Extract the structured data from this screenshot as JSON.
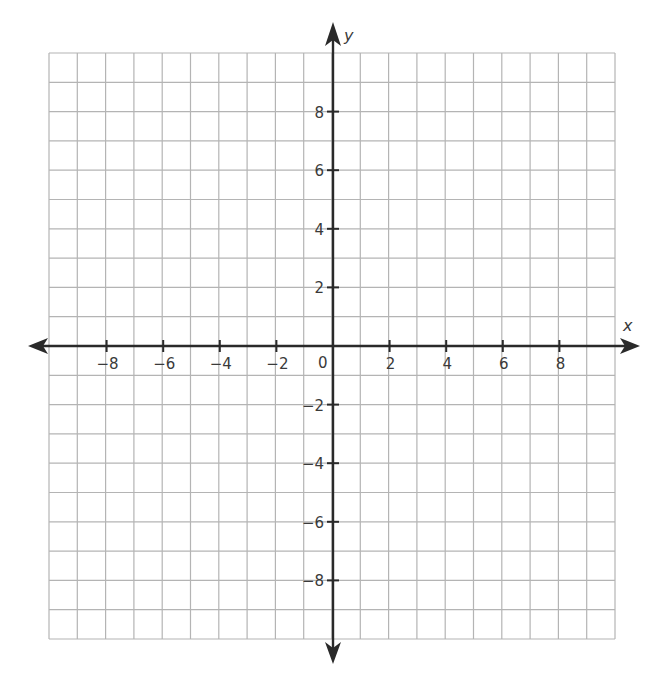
{
  "chart_data": {
    "type": "coordinate-grid",
    "title": "",
    "xlabel": "x",
    "ylabel": "y",
    "xlim": [
      -10,
      10
    ],
    "ylim": [
      -10,
      10
    ],
    "grid": true,
    "grid_step": 1,
    "x_ticks": [
      -8,
      -6,
      -4,
      -2,
      2,
      4,
      6,
      8
    ],
    "y_ticks": [
      8,
      6,
      4,
      2,
      -2,
      -4,
      -6,
      -8
    ],
    "origin_label": "0",
    "x_tick_labels": [
      "−8",
      "−6",
      "−4",
      "−2",
      "2",
      "4",
      "6",
      "8"
    ],
    "y_tick_labels": [
      "8",
      "6",
      "4",
      "2",
      "−2",
      "−4",
      "−6",
      "−8"
    ],
    "series": []
  },
  "colors": {
    "grid": "#b4b4b4",
    "axis": "#2a2a2a",
    "text": "#3a3a3a",
    "background": "#ffffff"
  }
}
